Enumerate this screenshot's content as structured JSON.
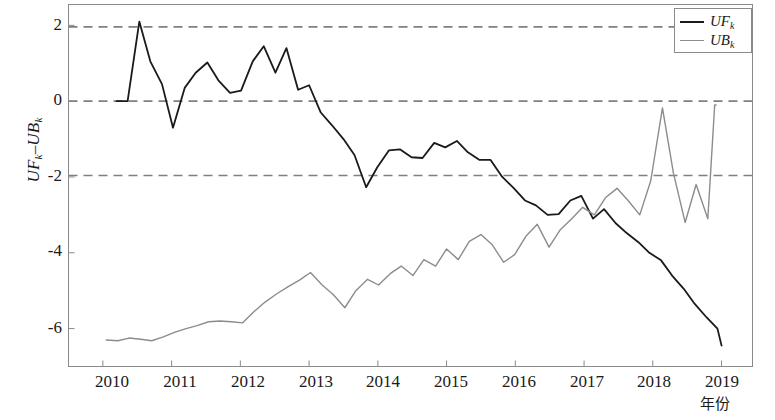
{
  "chart_data": {
    "type": "line",
    "title": "",
    "xlabel": "年份",
    "ylabel_parts": {
      "prefix": "UF",
      "sub1": "k",
      "mid": "–UB",
      "sub2": "k"
    },
    "ylabel_text": "UFk–UBk",
    "xlim": [
      2009.5,
      2019.45
    ],
    "ylim": [
      -7.0,
      2.55
    ],
    "xticks": [
      "2010",
      "2011",
      "2012",
      "2013",
      "2014",
      "2015",
      "2016",
      "2017",
      "2018",
      "2019"
    ],
    "xtick_values": [
      2010,
      2011,
      2012,
      2013,
      2014,
      2015,
      2016,
      2017,
      2018,
      2019
    ],
    "yticks": [
      "2",
      "0",
      "-2",
      "-4",
      "-6"
    ],
    "ytick_values": [
      2,
      0,
      -2,
      -4,
      -6
    ],
    "grid": false,
    "reference_lines": [
      {
        "y": 1.96,
        "style": "dashed",
        "color": "#808080"
      },
      {
        "y": 0.0,
        "style": "dashed",
        "color": "#808080"
      },
      {
        "y": -1.96,
        "style": "dashed",
        "color": "#808080"
      }
    ],
    "legend": {
      "position": "top-right",
      "entries": [
        {
          "label": "UFk",
          "base": "UF",
          "sub": "k",
          "color": "#1a1a1a"
        },
        {
          "label": "UBk",
          "base": "UB",
          "sub": "k",
          "color": "#8c8c8c"
        }
      ]
    },
    "series": [
      {
        "name": "UFk",
        "base": "UF",
        "sub": "k",
        "color": "#1a1a1a",
        "width": 1.8,
        "x": [
          2010.2,
          2010.36,
          2010.53,
          2010.69,
          2010.86,
          2011.02,
          2011.19,
          2011.35,
          2011.52,
          2011.68,
          2011.85,
          2012.01,
          2012.18,
          2012.34,
          2012.51,
          2012.67,
          2012.84,
          2013.0,
          2013.17,
          2013.33,
          2013.5,
          2013.66,
          2013.83,
          2013.99,
          2014.16,
          2014.32,
          2014.49,
          2014.65,
          2014.82,
          2014.98,
          2015.15,
          2015.31,
          2015.48,
          2015.64,
          2015.81,
          2015.97,
          2016.14,
          2016.3,
          2016.47,
          2016.63,
          2016.8,
          2016.96,
          2017.13,
          2017.29,
          2017.46,
          2017.62,
          2017.79,
          2017.95,
          2018.12,
          2018.28,
          2018.45,
          2018.61,
          2018.78,
          2018.94,
          2019.0
        ],
        "y": [
          0.0,
          0.0,
          2.1,
          1.05,
          0.45,
          -0.7,
          0.35,
          0.75,
          1.02,
          0.55,
          0.22,
          0.28,
          1.05,
          1.45,
          0.75,
          1.4,
          0.3,
          0.42,
          -0.3,
          -0.63,
          -1.0,
          -1.42,
          -2.27,
          -1.75,
          -1.3,
          -1.27,
          -1.48,
          -1.5,
          -1.1,
          -1.22,
          -1.05,
          -1.35,
          -1.55,
          -1.55,
          -2.0,
          -2.28,
          -2.62,
          -2.75,
          -3.0,
          -2.98,
          -2.62,
          -2.5,
          -3.1,
          -2.85,
          -3.22,
          -3.48,
          -3.72,
          -4.0,
          -4.2,
          -4.6,
          -4.95,
          -5.35,
          -5.7,
          -6.0,
          -6.45
        ]
      },
      {
        "name": "UBk",
        "base": "UB",
        "sub": "k",
        "color": "#8c8c8c",
        "width": 1.4,
        "x": [
          2010.05,
          2010.22,
          2010.38,
          2010.55,
          2010.71,
          2010.88,
          2011.04,
          2011.21,
          2011.37,
          2011.54,
          2011.7,
          2011.87,
          2012.03,
          2012.2,
          2012.36,
          2012.53,
          2012.69,
          2012.86,
          2013.02,
          2013.19,
          2013.35,
          2013.52,
          2013.68,
          2013.85,
          2014.01,
          2014.18,
          2014.34,
          2014.51,
          2014.67,
          2014.84,
          2015.0,
          2015.17,
          2015.33,
          2015.5,
          2015.66,
          2015.83,
          2015.99,
          2016.16,
          2016.32,
          2016.49,
          2016.65,
          2016.82,
          2016.98,
          2017.15,
          2017.31,
          2017.48,
          2017.64,
          2017.81,
          2017.97,
          2018.14,
          2018.3,
          2018.47,
          2018.63,
          2018.8,
          2018.9,
          2018.92
        ],
        "y": [
          -6.3,
          -6.32,
          -6.25,
          -6.28,
          -6.32,
          -6.22,
          -6.1,
          -6.0,
          -5.92,
          -5.82,
          -5.8,
          -5.82,
          -5.85,
          -5.55,
          -5.3,
          -5.08,
          -4.9,
          -4.72,
          -4.52,
          -4.85,
          -5.1,
          -5.45,
          -5.0,
          -4.7,
          -4.85,
          -4.55,
          -4.35,
          -4.6,
          -4.18,
          -4.35,
          -3.9,
          -4.18,
          -3.7,
          -3.52,
          -3.78,
          -4.25,
          -4.05,
          -3.55,
          -3.25,
          -3.85,
          -3.4,
          -3.1,
          -2.8,
          -3.0,
          -2.55,
          -2.3,
          -2.62,
          -3.0,
          -2.1,
          -0.18,
          -1.9,
          -3.2,
          -2.2,
          -3.1,
          -0.1,
          -0.1
        ]
      }
    ]
  }
}
